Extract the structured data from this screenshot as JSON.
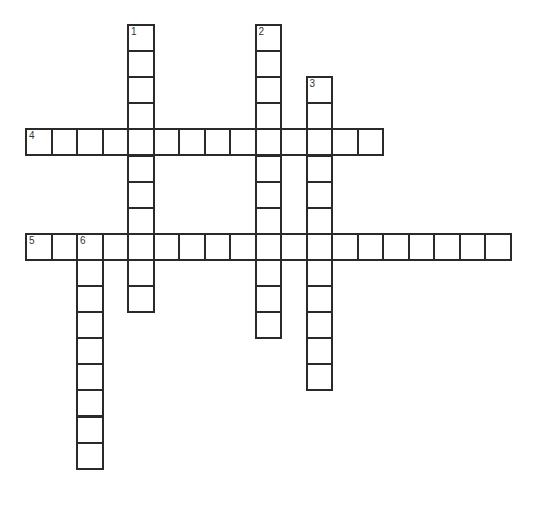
{
  "puzzle": {
    "type": "crossword",
    "cell_width": 25.5,
    "cell_height": 26.1,
    "origin_x": 26,
    "origin_y": 25,
    "border_color": "#2a2a2a",
    "words": [
      {
        "number": "1",
        "direction": "down",
        "row": 0,
        "col": 4,
        "length": 11
      },
      {
        "number": "2",
        "direction": "down",
        "row": 0,
        "col": 9,
        "length": 12
      },
      {
        "number": "3",
        "direction": "down",
        "row": 2,
        "col": 11,
        "length": 12
      },
      {
        "number": "4",
        "direction": "across",
        "row": 4,
        "col": 0,
        "length": 14
      },
      {
        "number": "5",
        "direction": "across",
        "row": 8,
        "col": 0,
        "length": 19
      },
      {
        "number": "6",
        "direction": "down",
        "row": 8,
        "col": 2,
        "length": 9
      }
    ]
  }
}
